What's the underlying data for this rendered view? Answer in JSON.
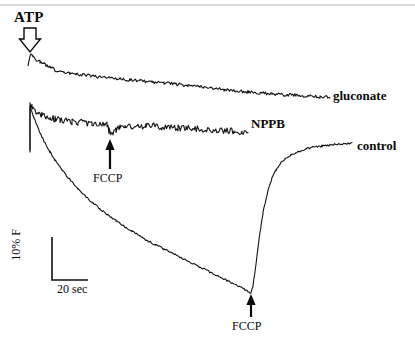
{
  "figure": {
    "background_color": "#ffffff",
    "trace_color": "#111111",
    "top_rule_color": "#b9b9b9"
  },
  "labels": {
    "atp": "ATP",
    "gluconate": "gluconate",
    "nppb": "NPPB",
    "control": "control",
    "fccp_nppb": "FCCP",
    "fccp_control": "FCCP",
    "scale_time": "20 sec",
    "scale_fluorescence": "10% F"
  },
  "chart_data": {
    "type": "line",
    "title": "",
    "xlabel": "",
    "ylabel": "",
    "grid": false,
    "legend": "inline-trace-labels",
    "axes": {
      "note": "No numeric axes drawn; calibration given by scale bars only.",
      "scale_bars": {
        "horizontal": {
          "label": "20 sec",
          "x_start_px": 52,
          "x_end_px": 88,
          "y_px": 280,
          "length_px": 36
        },
        "vertical": {
          "label": "10% F",
          "x_px": 52,
          "y_start_px": 237,
          "y_end_px": 280,
          "length_px": 43
        }
      }
    },
    "annotations": [
      {
        "text": "ATP",
        "arrow": "down-hollow",
        "x_px": 30,
        "y_px": 30,
        "applies_to": "all traces"
      },
      {
        "text": "FCCP",
        "arrow": "up-solid",
        "x_px": 110,
        "y_px": 168,
        "applies_to": "NPPB"
      },
      {
        "text": "FCCP",
        "arrow": "up-solid",
        "x_px": 251,
        "y_px": 316,
        "applies_to": "control"
      }
    ],
    "series": [
      {
        "name": "gluconate",
        "label_position": "right",
        "noise_amplitude_px": 1.6,
        "points": [
          [
            28,
            65
          ],
          [
            30,
            55
          ],
          [
            33,
            56
          ],
          [
            36,
            60
          ],
          [
            40,
            62
          ],
          [
            44,
            64
          ],
          [
            48,
            66
          ],
          [
            53,
            69
          ],
          [
            58,
            71
          ],
          [
            64,
            72
          ],
          [
            70,
            73
          ],
          [
            76,
            74
          ],
          [
            84,
            75
          ],
          [
            92,
            76
          ],
          [
            100,
            77
          ],
          [
            110,
            78
          ],
          [
            120,
            79
          ],
          [
            130,
            80
          ],
          [
            140,
            81
          ],
          [
            152,
            82
          ],
          [
            164,
            83
          ],
          [
            176,
            84
          ],
          [
            188,
            86
          ],
          [
            200,
            87
          ],
          [
            212,
            88
          ],
          [
            224,
            90
          ],
          [
            236,
            91
          ],
          [
            248,
            92
          ],
          [
            260,
            93
          ],
          [
            272,
            94
          ],
          [
            284,
            95
          ],
          [
            296,
            95
          ],
          [
            308,
            96
          ],
          [
            320,
            97
          ],
          [
            330,
            97
          ]
        ]
      },
      {
        "name": "NPPB",
        "label_position": "right",
        "noise_amplitude_px": 3.2,
        "points": [
          [
            30,
            150
          ],
          [
            30,
            104
          ],
          [
            32,
            106
          ],
          [
            35,
            110
          ],
          [
            38,
            113
          ],
          [
            42,
            115
          ],
          [
            46,
            117
          ],
          [
            50,
            118
          ],
          [
            55,
            119
          ],
          [
            60,
            120
          ],
          [
            66,
            121
          ],
          [
            72,
            122
          ],
          [
            78,
            122
          ],
          [
            85,
            123
          ],
          [
            92,
            123
          ],
          [
            99,
            124
          ],
          [
            104,
            124
          ],
          [
            107,
            125
          ],
          [
            109,
            131
          ],
          [
            111,
            136
          ],
          [
            113,
            133
          ],
          [
            116,
            130
          ],
          [
            120,
            128
          ],
          [
            125,
            127
          ],
          [
            131,
            126
          ],
          [
            138,
            126
          ],
          [
            146,
            126
          ],
          [
            154,
            126
          ],
          [
            162,
            127
          ],
          [
            170,
            127
          ],
          [
            178,
            128
          ],
          [
            186,
            128
          ],
          [
            194,
            129
          ],
          [
            202,
            129
          ],
          [
            210,
            130
          ],
          [
            218,
            130
          ],
          [
            226,
            131
          ],
          [
            234,
            131
          ],
          [
            242,
            132
          ],
          [
            248,
            132
          ]
        ]
      },
      {
        "name": "control",
        "label_position": "right",
        "noise_amplitude_px": 0.9,
        "points": [
          [
            30,
            152
          ],
          [
            30,
            107
          ],
          [
            34,
            118
          ],
          [
            38,
            128
          ],
          [
            42,
            137
          ],
          [
            46,
            145
          ],
          [
            50,
            152
          ],
          [
            55,
            160
          ],
          [
            60,
            167
          ],
          [
            66,
            175
          ],
          [
            72,
            182
          ],
          [
            78,
            189
          ],
          [
            85,
            196
          ],
          [
            92,
            202
          ],
          [
            100,
            209
          ],
          [
            108,
            215
          ],
          [
            116,
            221
          ],
          [
            124,
            226
          ],
          [
            132,
            231
          ],
          [
            140,
            236
          ],
          [
            148,
            241
          ],
          [
            156,
            245
          ],
          [
            164,
            249
          ],
          [
            172,
            253
          ],
          [
            180,
            257
          ],
          [
            188,
            261
          ],
          [
            196,
            265
          ],
          [
            204,
            269
          ],
          [
            212,
            273
          ],
          [
            220,
            277
          ],
          [
            228,
            281
          ],
          [
            236,
            285
          ],
          [
            244,
            289
          ],
          [
            249,
            292
          ],
          [
            251,
            293
          ],
          [
            253,
            286
          ],
          [
            255,
            272
          ],
          [
            257,
            256
          ],
          [
            259,
            240
          ],
          [
            261,
            226
          ],
          [
            263,
            213
          ],
          [
            266,
            199
          ],
          [
            269,
            187
          ],
          [
            272,
            178
          ],
          [
            276,
            170
          ],
          [
            280,
            164
          ],
          [
            285,
            159
          ],
          [
            291,
            155
          ],
          [
            298,
            152
          ],
          [
            306,
            149
          ],
          [
            314,
            147
          ],
          [
            322,
            146
          ],
          [
            330,
            145
          ],
          [
            338,
            144
          ],
          [
            346,
            144
          ],
          [
            352,
            143
          ]
        ]
      }
    ]
  }
}
